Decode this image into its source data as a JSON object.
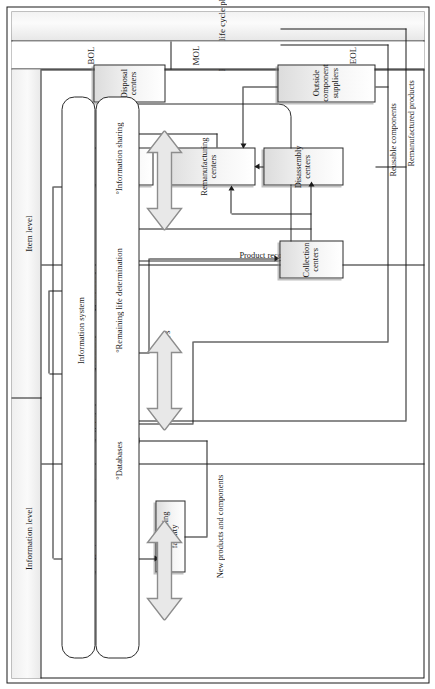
{
  "figure": {
    "title_band": "Product life cycle phases",
    "phases": [
      {
        "id": "bol",
        "label": "BOL"
      },
      {
        "id": "mol",
        "label": "MOL"
      },
      {
        "id": "eol",
        "label": "EOL"
      }
    ],
    "levels": [
      {
        "id": "item",
        "label": "Item level"
      },
      {
        "id": "information",
        "label": "Information level"
      }
    ]
  },
  "bol": {
    "boxes": [
      {
        "id": "design-center",
        "label": "Design center"
      },
      {
        "id": "manufacturing-facility",
        "label": "Manufacturing facility"
      }
    ],
    "flow_label": "New products and components"
  },
  "mol": {
    "boxes": [
      {
        "id": "retail-distributors",
        "label": "Retail distributors"
      },
      {
        "id": "consumer-sites",
        "label": "Consumer sites"
      },
      {
        "id": "maintenance-centers",
        "label": "Maintenance centers"
      }
    ],
    "flow_label": "EOLPs"
  },
  "eol": {
    "group_label": "Product recovery centers",
    "boxes": [
      {
        "id": "collection-centers",
        "label": "Collection centers"
      },
      {
        "id": "disassembly-centers",
        "label": "Disassembly centers"
      },
      {
        "id": "remanufacturing-centers",
        "label": "Remanufacturing centers"
      },
      {
        "id": "recycling-centers",
        "label": "Recycling centers"
      },
      {
        "id": "outside-component-suppliers",
        "label": "Outside component suppliers"
      },
      {
        "id": "disposal-centers",
        "label": "Disposal centers"
      }
    ],
    "flow_labels": [
      "Remanufactured products",
      "Reusable components"
    ]
  },
  "materials": {
    "label": "Materials"
  },
  "information_system": {
    "label": "Information system",
    "bullets": [
      "°Databases",
      "°Remaining life determination",
      "°Information sharing"
    ]
  },
  "colors": {
    "line": "#1a1a1a",
    "box_fill_top": "#ffffff",
    "box_fill_bottom": "#dcdcdc",
    "band_fill": "#efefef",
    "big_arrow_fill": "#e8e8e8"
  }
}
